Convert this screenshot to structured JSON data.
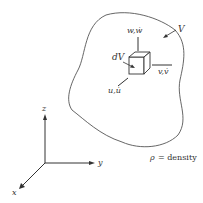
{
  "diagram": {
    "volume_label": "V",
    "element_label": "dV",
    "velocity_labels": {
      "w": "w,ẇ",
      "v": "v,v̇",
      "u": "u,u̇"
    },
    "axes": {
      "x": "x",
      "y": "y",
      "z": "z"
    },
    "legend": {
      "symbol": "ρ",
      "text": "= density"
    },
    "colors": {
      "stroke": "#444444",
      "text": "#333333",
      "background": "#ffffff"
    }
  }
}
